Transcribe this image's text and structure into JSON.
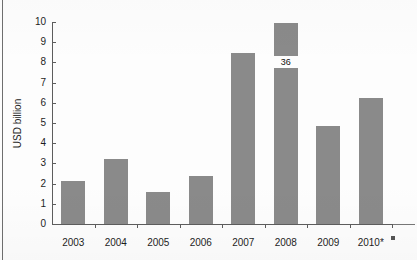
{
  "chart_data": {
    "type": "bar",
    "title": "",
    "subtitle": "",
    "xlabel": "",
    "ylabel": "USD billion",
    "categories": [
      "2003",
      "2004",
      "2005",
      "2006",
      "2007",
      "2008",
      "2009",
      "2010*"
    ],
    "values": [
      2.15,
      3.2,
      1.6,
      2.4,
      8.45,
      9.95,
      4.85,
      6.25
    ],
    "series": [
      {
        "name": "USD billion",
        "values": [
          2.15,
          3.2,
          1.6,
          2.4,
          8.45,
          9.95,
          4.85,
          6.25
        ]
      }
    ],
    "ylim": [
      0,
      10
    ],
    "ytick_labels": [
      "0",
      "1",
      "2",
      "3",
      "4",
      "5",
      "6",
      "7",
      "8",
      "9",
      "10"
    ],
    "ytick_values": [
      0,
      1,
      2,
      3,
      4,
      5,
      6,
      7,
      8,
      9,
      10
    ],
    "grid": false,
    "legend": false,
    "legend_position": "none",
    "bar_color": "#8a8a8a",
    "axis_color": "#5d5d5d",
    "text_color": "#1d1d1d",
    "background_color": "#fdfdfd",
    "annotations": [
      {
        "text": "36",
        "category": "2008",
        "value": 8.0,
        "note": "overlaid label interrupting the 2008 bar"
      }
    ]
  },
  "figure": {
    "axis_title_y": "USD billion"
  }
}
